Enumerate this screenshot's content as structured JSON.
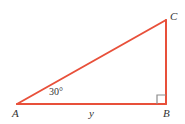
{
  "figure": {
    "kind": "right-triangle-diagram",
    "width": 185,
    "height": 124,
    "background_color": "#ffffff",
    "stroke_color": "#e8503a",
    "stroke_width": 2,
    "label_color": "#333333",
    "right_angle_marker_color": "#8c8c8c"
  },
  "labels": {
    "vertex_c": "C",
    "vertex_b": "B",
    "vertex_a": "A",
    "side_ab": "y",
    "angle_a": "30°"
  },
  "geometry": {
    "vertices": {
      "a": {
        "x": 17,
        "y": 104
      },
      "b": {
        "x": 166,
        "y": 104
      },
      "c": {
        "x": 166,
        "y": 20
      }
    },
    "segments": [
      {
        "name": "side-ab",
        "from": "a",
        "to": "b"
      },
      {
        "name": "side-bc",
        "from": "b",
        "to": "c"
      },
      {
        "name": "side-ac-hypotenuse",
        "from": "a",
        "to": "c"
      }
    ],
    "right_angle_marker": {
      "x": 157,
      "y": 95,
      "size": 9,
      "at_vertex": "b"
    }
  }
}
